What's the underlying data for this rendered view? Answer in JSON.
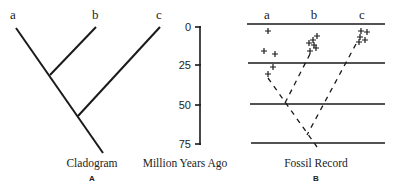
{
  "panel_a": {
    "taxa": [
      "a",
      "b",
      "c"
    ],
    "caption": "Cladogram",
    "letter": "A"
  },
  "axis": {
    "title": "Million Years Ago",
    "ticks": [
      "0",
      "25",
      "50",
      "75"
    ]
  },
  "panel_b": {
    "taxa": [
      "a",
      "b",
      "c"
    ],
    "caption": "Fossil Record",
    "letter": "B"
  },
  "colors": {
    "line": "#1a1a1a",
    "text": "#222222"
  }
}
